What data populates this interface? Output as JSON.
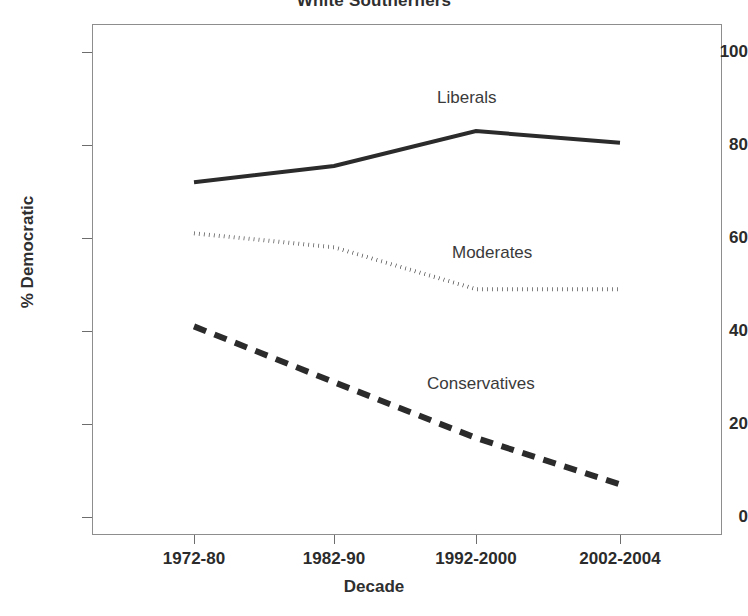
{
  "chart_data": {
    "type": "line",
    "title": "White Southerners",
    "xlabel": "Decade",
    "ylabel": "% Democratic",
    "categories": [
      "1972-80",
      "1982-90",
      "1992-2000",
      "2002-2004"
    ],
    "ylim": [
      0,
      108
    ],
    "yticks": [
      0,
      20,
      40,
      60,
      80,
      100
    ],
    "ytick_labels": [
      "0",
      "20",
      "40",
      "60",
      "80",
      "100"
    ],
    "grid": false,
    "legend_position": "inline-annotations",
    "series": [
      {
        "name": "Liberals",
        "values": [
          72,
          75.5,
          83,
          80.5
        ],
        "style": "solid",
        "color": "#2b2b2b",
        "width": 4
      },
      {
        "name": "Moderates",
        "values": [
          61,
          58,
          49,
          49
        ],
        "style": "dotted",
        "color": "#2b2b2b",
        "width": 4
      },
      {
        "name": "Conservatives",
        "values": [
          41,
          29,
          17,
          7
        ],
        "style": "dashed",
        "color": "#2b2b2b",
        "width": 6
      }
    ],
    "annotations": [
      {
        "text": "Liberals",
        "series": "Liberals"
      },
      {
        "text": "Moderates",
        "series": "Moderates"
      },
      {
        "text": "Conservatives",
        "series": "Conservatives"
      }
    ]
  },
  "colors": {
    "ink": "#2b2b2b",
    "frame": "#8d8d8d",
    "background": "#ffffff"
  }
}
